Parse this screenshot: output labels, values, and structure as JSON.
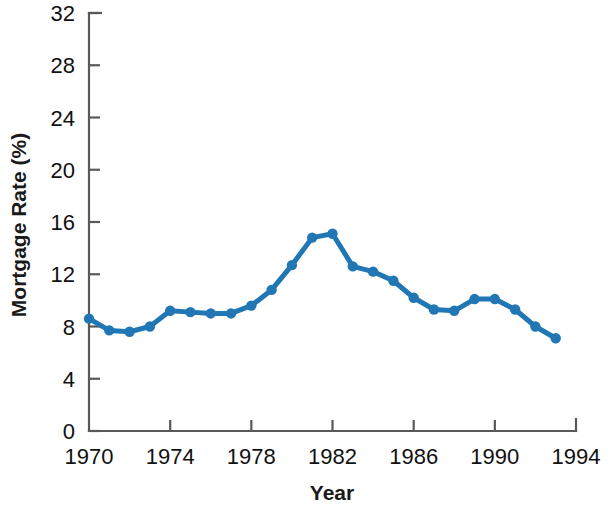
{
  "chart_data": {
    "type": "line",
    "title": "",
    "subtitle": "",
    "xlabel": "Year",
    "ylabel": "Mortgage Rate (%)",
    "xlim": [
      1970,
      1994
    ],
    "ylim": [
      0,
      32
    ],
    "xticks": [
      1970,
      1974,
      1978,
      1982,
      1986,
      1990,
      1994
    ],
    "xtick_labels": [
      "1970",
      "1974",
      "1978",
      "1982",
      "1986",
      "1990",
      "1994"
    ],
    "yticks": [
      0,
      4,
      8,
      12,
      16,
      20,
      24,
      28,
      32
    ],
    "ytick_labels": [
      "0",
      "4",
      "8",
      "12",
      "16",
      "20",
      "24",
      "28",
      "32"
    ],
    "grid": false,
    "legend": "none",
    "marker": "circle",
    "series_color": "#2077b4",
    "axis_color": "#59595c",
    "text_color": "#111111",
    "x": [
      1970,
      1971,
      1972,
      1973,
      1974,
      1975,
      1976,
      1977,
      1978,
      1979,
      1980,
      1981,
      1982,
      1983,
      1984,
      1985,
      1986,
      1987,
      1988,
      1989,
      1990,
      1991,
      1992,
      1993
    ],
    "values": [
      8.6,
      7.7,
      7.6,
      8.0,
      9.2,
      9.1,
      9.0,
      9.0,
      9.6,
      10.8,
      12.7,
      14.8,
      15.1,
      12.6,
      12.2,
      11.5,
      10.2,
      9.3,
      9.2,
      10.1,
      10.1,
      9.3,
      8.0,
      7.1
    ],
    "series": [
      {
        "name": "Mortgage Rate",
        "color": "#2077b4",
        "values": [
          8.6,
          7.7,
          7.6,
          8.0,
          9.2,
          9.1,
          9.0,
          9.0,
          9.6,
          10.8,
          12.7,
          14.8,
          15.1,
          12.6,
          12.2,
          11.5,
          10.2,
          9.3,
          9.2,
          10.1,
          10.1,
          9.3,
          8.0,
          7.1
        ]
      }
    ]
  }
}
